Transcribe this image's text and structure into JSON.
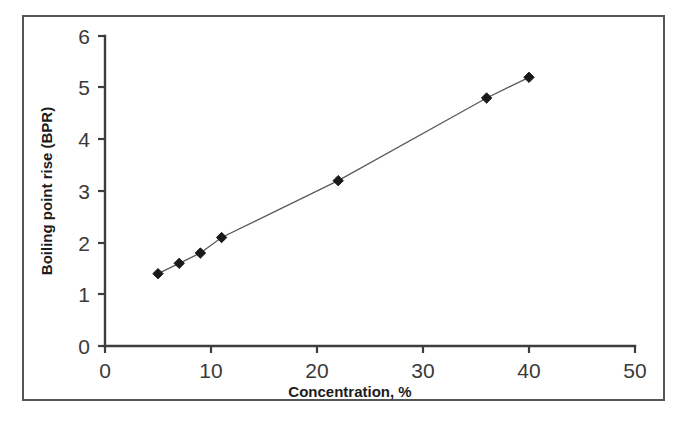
{
  "figure": {
    "background_color": "#ffffff",
    "border_color": "#565656",
    "marker_color": "#1a1a1a",
    "line_color": "#5a5a5a",
    "axis_color": "#3d3d3d"
  },
  "chart_data": {
    "type": "line",
    "title": "",
    "subtitle": "",
    "xlabel": "Concentration, %",
    "ylabel": "Boiling point rise (BPR)",
    "xlim": [
      0,
      50
    ],
    "ylim": [
      0,
      6
    ],
    "xticks": [
      "0",
      "10",
      "20",
      "30",
      "40",
      "50"
    ],
    "yticks": [
      "0",
      "1",
      "2",
      "3",
      "4",
      "5",
      "6"
    ],
    "xtick_values": [
      0,
      10,
      20,
      30,
      40,
      50
    ],
    "ytick_values": [
      0,
      1,
      2,
      3,
      4,
      5,
      6
    ],
    "grid": false,
    "legend": false,
    "legend_position": "none",
    "marker_style": "diamond",
    "series": [
      {
        "name": "Boiling point rise",
        "x": [
          5,
          7,
          9,
          11,
          22,
          36,
          40
        ],
        "y": [
          1.4,
          1.6,
          1.8,
          2.1,
          3.2,
          4.8,
          5.2
        ]
      }
    ],
    "annotations": []
  }
}
